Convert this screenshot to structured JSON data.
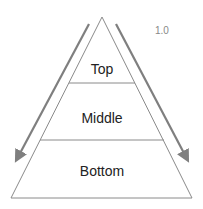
{
  "diagram": {
    "type": "pyramid",
    "version_label": "1.0",
    "levels": [
      {
        "label": "Top"
      },
      {
        "label": "Middle"
      },
      {
        "label": "Bottom"
      }
    ],
    "arrows": [
      {
        "side": "left",
        "direction": "down"
      },
      {
        "side": "right",
        "direction": "down"
      }
    ],
    "colors": {
      "outline": "#888888",
      "arrow": "#7f7f7f",
      "text": "#222222",
      "version_text": "#888888"
    }
  }
}
